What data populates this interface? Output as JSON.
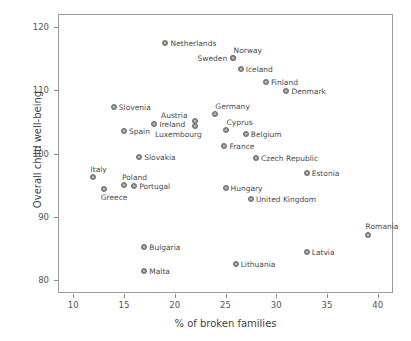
{
  "chart_data": {
    "type": "scatter",
    "title": "",
    "xlabel": "% of broken families",
    "ylabel": "Overall child well-being",
    "xlim": [
      8.5,
      41.5
    ],
    "ylim": [
      78,
      122
    ],
    "xticks": [
      10,
      15,
      20,
      25,
      30,
      35,
      40
    ],
    "yticks": [
      80,
      90,
      100,
      110,
      120
    ],
    "grid": false,
    "legend": null,
    "marker_color": "#8b8b8b",
    "frame_color": "#9a9a9a",
    "text_color": "#4a4a4a",
    "points": [
      {
        "name": "Netherlands",
        "x": 19.0,
        "y": 117.5,
        "label_dx": 6,
        "label_dy": -4
      },
      {
        "name": "Sweden",
        "x": 25.7,
        "y": 115.0,
        "label_dx": -35,
        "label_dy": -4
      },
      {
        "name": "Norway",
        "x": 25.7,
        "y": 115.0,
        "label_dx": 1,
        "label_dy": -12
      },
      {
        "name": "Iceland",
        "x": 26.5,
        "y": 113.4,
        "label_dx": 5,
        "label_dy": -4
      },
      {
        "name": "Finland",
        "x": 29.0,
        "y": 111.2,
        "label_dx": 5,
        "label_dy": -4
      },
      {
        "name": "Denmark",
        "x": 31.0,
        "y": 109.8,
        "label_dx": 5,
        "label_dy": -4
      },
      {
        "name": "Slovenia",
        "x": 14.0,
        "y": 107.4,
        "label_dx": 5,
        "label_dy": -4
      },
      {
        "name": "Germany",
        "x": 24.0,
        "y": 106.2,
        "label_dx": 0,
        "label_dy": -12
      },
      {
        "name": "Austria",
        "x": 22.0,
        "y": 105.1,
        "label_dx": -34,
        "label_dy": -10
      },
      {
        "name": "Ireland",
        "x": 18.0,
        "y": 104.7,
        "label_dx": 5,
        "label_dy": -4
      },
      {
        "name": "Luxembourg",
        "x": 22.0,
        "y": 104.3,
        "label_dx": -40,
        "label_dy": 4
      },
      {
        "name": "Cyprus",
        "x": 25.0,
        "y": 103.7,
        "label_dx": 1,
        "label_dy": -12
      },
      {
        "name": "Spain",
        "x": 15.0,
        "y": 103.5,
        "label_dx": 5,
        "label_dy": -4
      },
      {
        "name": "Belgium",
        "x": 27.0,
        "y": 103.1,
        "label_dx": 5,
        "label_dy": -4
      },
      {
        "name": "France",
        "x": 24.9,
        "y": 101.2,
        "label_dx": 5,
        "label_dy": -4
      },
      {
        "name": "Slovakia",
        "x": 16.5,
        "y": 99.4,
        "label_dx": 5,
        "label_dy": -4
      },
      {
        "name": "Czech Republic",
        "x": 28.0,
        "y": 99.3,
        "label_dx": 5,
        "label_dy": -4
      },
      {
        "name": "Estonia",
        "x": 33.0,
        "y": 97.0,
        "label_dx": 5,
        "label_dy": -4
      },
      {
        "name": "Italy",
        "x": 11.9,
        "y": 96.3,
        "label_dx": -2,
        "label_dy": -12
      },
      {
        "name": "Poland",
        "x": 15.0,
        "y": 95.0,
        "label_dx": -2,
        "label_dy": -12
      },
      {
        "name": "Portugal",
        "x": 16.0,
        "y": 94.8,
        "label_dx": 5,
        "label_dy": -4
      },
      {
        "name": "Hungary",
        "x": 25.0,
        "y": 94.6,
        "label_dx": 5,
        "label_dy": -4
      },
      {
        "name": "Greece",
        "x": 13.0,
        "y": 94.4,
        "label_dx": -3,
        "label_dy": 4
      },
      {
        "name": "United Kingdom",
        "x": 27.5,
        "y": 92.8,
        "label_dx": 5,
        "label_dy": -4
      },
      {
        "name": "Romania",
        "x": 39.0,
        "y": 87.2,
        "label_dx": -2,
        "label_dy": -13
      },
      {
        "name": "Bulgaria",
        "x": 17.0,
        "y": 85.2,
        "label_dx": 5,
        "label_dy": -4
      },
      {
        "name": "Latvia",
        "x": 33.0,
        "y": 84.5,
        "label_dx": 5,
        "label_dy": -4
      },
      {
        "name": "Lithuania",
        "x": 26.0,
        "y": 82.5,
        "label_dx": 5,
        "label_dy": -4
      },
      {
        "name": "Malta",
        "x": 17.0,
        "y": 81.5,
        "label_dx": 5,
        "label_dy": -4
      }
    ]
  }
}
